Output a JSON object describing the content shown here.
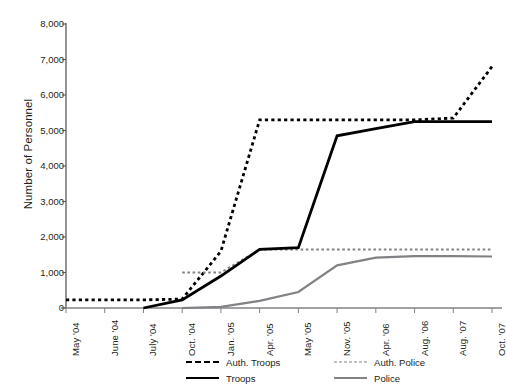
{
  "chart_data": {
    "type": "line",
    "title": "",
    "xlabel": "",
    "ylabel": "Number of Personnel",
    "ylim": [
      0,
      8000
    ],
    "yticks": [
      0,
      1000,
      2000,
      3000,
      4000,
      5000,
      6000,
      7000,
      8000
    ],
    "ytick_labels": [
      "0",
      "1,000",
      "2,000",
      "3,000",
      "4,000",
      "5,000",
      "6,000",
      "7,000",
      "8,000"
    ],
    "grid": false,
    "legend_position": "bottom",
    "categories": [
      "May '04",
      "June '04",
      "July '04",
      "Oct. '04",
      "Jan. '05",
      "Apr. '05",
      "May '05",
      "Nov. '05",
      "Apr. '06",
      "Aug. '06",
      "Aug. '07",
      "Oct. '07"
    ],
    "series": [
      {
        "name": "Auth. Troops",
        "style": "dashed",
        "color": "#000000",
        "width": 2.8,
        "values": [
          230,
          230,
          230,
          250,
          1600,
          5300,
          5300,
          5300,
          5300,
          5300,
          5350,
          6800
        ]
      },
      {
        "name": "Auth. Police",
        "style": "dashed",
        "color": "#808285",
        "width": 1.9,
        "values": [
          null,
          null,
          null,
          1000,
          1000,
          1650,
          1650,
          1650,
          1650,
          1650,
          1650,
          1650
        ]
      },
      {
        "name": "Troops",
        "style": "solid",
        "color": "#000000",
        "width": 2.8,
        "values": [
          null,
          null,
          0,
          230,
          900,
          1650,
          1700,
          4850,
          5050,
          5250,
          5250,
          5250
        ]
      },
      {
        "name": "Police",
        "style": "solid",
        "color": "#808285",
        "width": 2.2,
        "values": [
          null,
          null,
          null,
          0,
          30,
          200,
          450,
          1200,
          1420,
          1460,
          1460,
          1450
        ]
      }
    ]
  },
  "legend": {
    "rows": [
      [
        {
          "label": "Auth. Troops",
          "swatch": "sw-auth-troops"
        },
        {
          "label": "Auth. Police",
          "swatch": "sw-auth-police"
        }
      ],
      [
        {
          "label": "Troops",
          "swatch": "sw-troops"
        },
        {
          "label": "Police",
          "swatch": "sw-police"
        }
      ]
    ]
  }
}
